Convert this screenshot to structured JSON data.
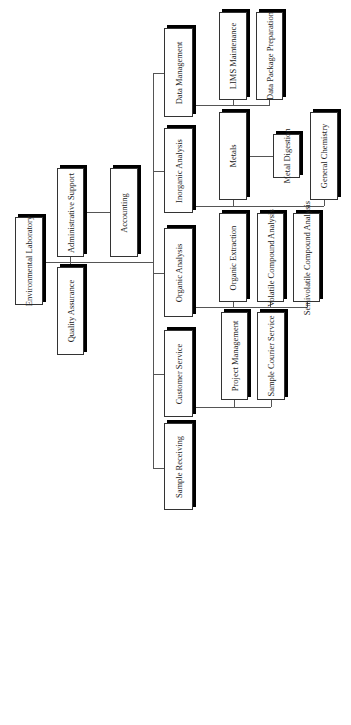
{
  "chart_orientation": "rotated -90deg (reads bottom-to-top)",
  "root": {
    "label": "Environmental Laboratory"
  },
  "staff": [
    {
      "label": "Administrative Support",
      "children": [
        {
          "label": "Accounting"
        }
      ]
    },
    {
      "label": "Quality Assurance"
    }
  ],
  "departments": [
    {
      "label": "Data Management",
      "children": [
        {
          "label": "LIMS Maintenance"
        },
        {
          "label": "Data Package Preparation"
        }
      ]
    },
    {
      "label": "Inorganic Analysis",
      "children": [
        {
          "label": "Metals",
          "children": [
            {
              "label": "Metal Digestion"
            }
          ]
        },
        {
          "label": "General Chemistry"
        }
      ]
    },
    {
      "label": "Organic Analysis",
      "children": [
        {
          "label": "Organic Extraction"
        },
        {
          "label": "Volatile Compound Analysis"
        },
        {
          "label": "Semivolatile Compound Analysis"
        }
      ]
    },
    {
      "label": "Customer Service",
      "children": [
        {
          "label": "Project Management"
        },
        {
          "label": "Sample Courier Service"
        }
      ]
    },
    {
      "label": "Sample Receiving"
    }
  ]
}
